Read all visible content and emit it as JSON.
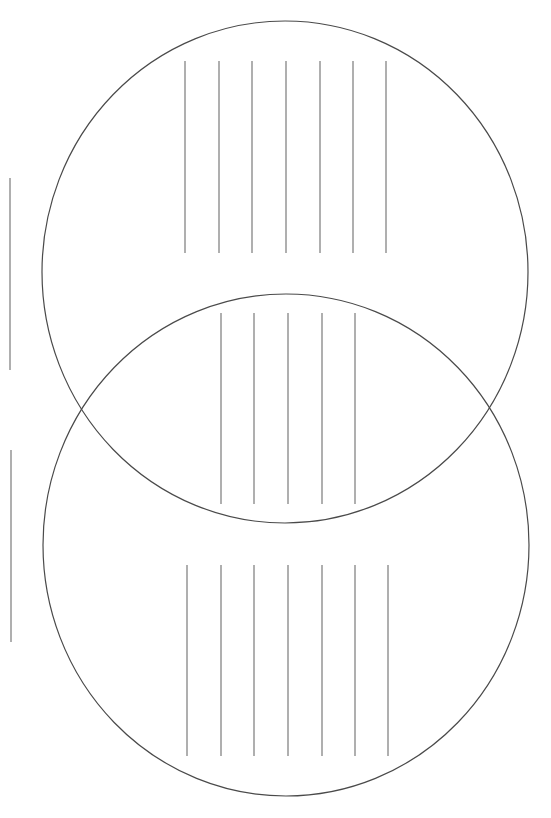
{
  "diagram": {
    "type": "venn-worksheet",
    "background": "#ffffff",
    "circle_stroke": "#4a4a4a",
    "line_stroke": "#7a7a7a",
    "circles": [
      {
        "name": "top-circle",
        "cx": 285,
        "cy": 272,
        "rx": 243,
        "ry": 251
      },
      {
        "name": "bottom-circle",
        "cx": 286,
        "cy": 545,
        "rx": 243,
        "ry": 251
      }
    ],
    "writing_line_groups": [
      {
        "name": "top-circle-lines",
        "y1": 61,
        "y2": 253,
        "xs": [
          185,
          219,
          252,
          286,
          320,
          353,
          386
        ]
      },
      {
        "name": "overlap-lines",
        "y1": 313,
        "y2": 504,
        "xs": [
          221,
          254,
          288,
          322,
          355
        ]
      },
      {
        "name": "bottom-circle-lines",
        "y1": 565,
        "y2": 756,
        "xs": [
          187,
          221,
          254,
          288,
          322,
          355,
          388
        ]
      }
    ],
    "side_label_lines": [
      {
        "name": "top-circle-label-line",
        "x": 10,
        "y1": 178,
        "y2": 370
      },
      {
        "name": "bottom-circle-label-line",
        "x": 11,
        "y1": 450,
        "y2": 642
      }
    ]
  }
}
